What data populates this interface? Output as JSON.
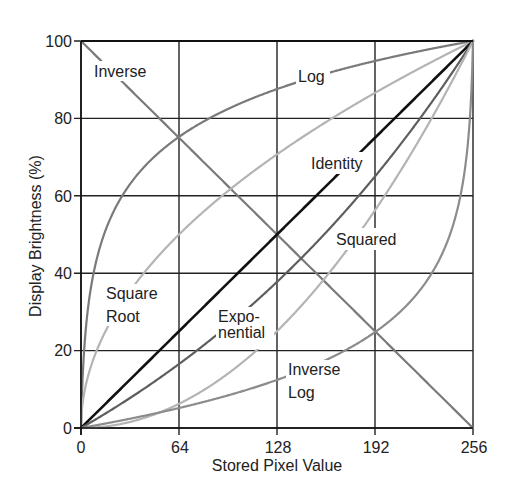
{
  "chart_data": {
    "type": "line",
    "title": "",
    "xlabel": "Stored Pixel Value",
    "ylabel": "Display Brightness (%)",
    "xlim": [
      0,
      256
    ],
    "ylim": [
      0,
      100
    ],
    "xticks": [
      0,
      64,
      128,
      192,
      256
    ],
    "yticks": [
      0,
      20,
      40,
      60,
      80,
      100
    ],
    "grid": true,
    "legend": "inline labels",
    "x": [
      0,
      16,
      32,
      48,
      64,
      80,
      96,
      112,
      128,
      144,
      160,
      176,
      192,
      208,
      224,
      240,
      256
    ],
    "series": [
      {
        "name": "Inverse",
        "color": "#7a7a7a",
        "width": 2.2,
        "values": [
          100,
          93.75,
          87.5,
          81.25,
          75,
          68.75,
          62.5,
          56.25,
          50,
          43.75,
          37.5,
          31.25,
          25,
          18.75,
          12.5,
          6.25,
          0
        ]
      },
      {
        "name": "Log",
        "color": "#7a7a7a",
        "width": 2.2,
        "values": [
          0,
          51.1,
          63.0,
          70.1,
          75.2,
          79.2,
          82.5,
          85.2,
          87.6,
          89.8,
          91.7,
          93.4,
          94.9,
          96.4,
          97.7,
          98.9,
          100
        ]
      },
      {
        "name": "Square Root",
        "color": "#b4b4b4",
        "width": 2.2,
        "values": [
          0,
          25,
          35.4,
          43.3,
          50,
          55.9,
          61.2,
          66.1,
          70.7,
          75,
          79.1,
          82.9,
          86.6,
          90.1,
          93.5,
          96.8,
          100
        ]
      },
      {
        "name": "Identity",
        "color": "#111111",
        "width": 2.6,
        "values": [
          0,
          6.25,
          12.5,
          18.75,
          25,
          31.25,
          37.5,
          43.75,
          50,
          56.25,
          62.5,
          68.75,
          75,
          81.25,
          87.5,
          93.75,
          100
        ]
      },
      {
        "name": "Exponential",
        "color": "#5e5e5e",
        "width": 2.2,
        "values": [
          0,
          3.7,
          7.6,
          11.9,
          16.5,
          21.3,
          26.5,
          32.1,
          37.8,
          44.1,
          50.7,
          57.8,
          65.3,
          73.4,
          81.9,
          90.8,
          100
        ]
      },
      {
        "name": "Squared",
        "color": "#b4b4b4",
        "width": 2.2,
        "values": [
          0,
          0.39,
          1.56,
          3.52,
          6.25,
          9.77,
          14.06,
          19.14,
          25,
          31.64,
          39.06,
          47.27,
          56.25,
          66.02,
          76.56,
          87.89,
          100
        ]
      },
      {
        "name": "Inverse Log",
        "color": "#8c8c8c",
        "width": 2.2,
        "values": [
          0,
          1.1,
          2.3,
          3.6,
          5.1,
          6.6,
          8.3,
          10.2,
          12.4,
          14.8,
          17.5,
          20.8,
          24.8,
          29.9,
          37.0,
          48.9,
          100
        ]
      }
    ]
  },
  "labels": {
    "inverse": "Inverse",
    "log": "Log",
    "identity": "Identity",
    "squared": "Squared",
    "square_root_1": "Square",
    "square_root_2": "Root",
    "exponential_1": "Expo-",
    "exponential_2": "nential",
    "inverse_log_1": "Inverse",
    "inverse_log_2": "Log"
  },
  "axes": {
    "x_title": "Stored Pixel Value",
    "y_title": "Display Brightness (%)",
    "x_ticks": [
      "0",
      "64",
      "128",
      "192",
      "256"
    ],
    "y_ticks": [
      "0",
      "20",
      "40",
      "60",
      "80",
      "100"
    ]
  }
}
